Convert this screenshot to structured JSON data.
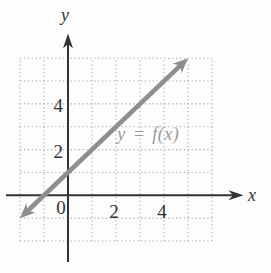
{
  "figure": {
    "background": "#fdfdfd"
  },
  "chart_data": {
    "type": "line",
    "title": "",
    "xlabel": "x",
    "ylabel": "y",
    "origin_label": "0",
    "x_range": [
      -2,
      6
    ],
    "y_range": [
      -2,
      6
    ],
    "grid": {
      "style": "dotted",
      "step": 1,
      "color": "#aaaaaa"
    },
    "axis_color": "#333333",
    "x_ticks": [
      {
        "value": 2,
        "label": "2"
      },
      {
        "value": 4,
        "label": "4"
      }
    ],
    "y_ticks": [
      {
        "value": 2,
        "label": "2"
      },
      {
        "value": 4,
        "label": "4"
      }
    ],
    "series": [
      {
        "name": "y = f(x)",
        "implied_equation": "y = x + 1",
        "slope": 1,
        "intercept": 1,
        "points": [
          {
            "x": -2,
            "y": -1
          },
          {
            "x": 5,
            "y": 6
          }
        ],
        "color": "#8e8e8e",
        "arrows": "both"
      }
    ],
    "annotation": {
      "text": "y = f(x)",
      "x": 2.05,
      "y": 2.7,
      "color": "#9a9a9a"
    }
  }
}
